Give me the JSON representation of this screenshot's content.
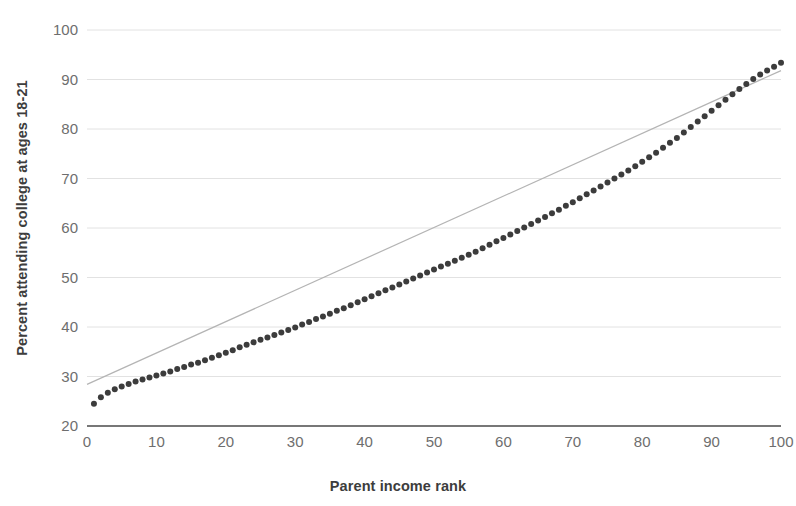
{
  "chart_data": {
    "type": "scatter",
    "title": "",
    "subtitle": "",
    "xlabel": "Parent income rank",
    "ylabel": "Percent attending college at ages 18-21",
    "xlim": [
      0,
      100
    ],
    "ylim": [
      20,
      100
    ],
    "xticks": [
      0,
      10,
      20,
      30,
      40,
      50,
      60,
      70,
      80,
      90,
      100
    ],
    "yticks": [
      20,
      30,
      40,
      50,
      60,
      70,
      80,
      90,
      100
    ],
    "grid": "horizontal",
    "legend": "none",
    "annotations": [],
    "series": [
      {
        "name": "Percent attending college at ages 18-21",
        "type": "scatter",
        "marker": "circle",
        "color": "#3c3c3c",
        "x": [
          1,
          2,
          3,
          4,
          5,
          6,
          7,
          8,
          9,
          10,
          11,
          12,
          13,
          14,
          15,
          16,
          17,
          18,
          19,
          20,
          21,
          22,
          23,
          24,
          25,
          26,
          27,
          28,
          29,
          30,
          31,
          32,
          33,
          34,
          35,
          36,
          37,
          38,
          39,
          40,
          41,
          42,
          43,
          44,
          45,
          46,
          47,
          48,
          49,
          50,
          51,
          52,
          53,
          54,
          55,
          56,
          57,
          58,
          59,
          60,
          61,
          62,
          63,
          64,
          65,
          66,
          67,
          68,
          69,
          70,
          71,
          72,
          73,
          74,
          75,
          76,
          77,
          78,
          79,
          80,
          81,
          82,
          83,
          84,
          85,
          86,
          87,
          88,
          89,
          90,
          91,
          92,
          93,
          94,
          95,
          96,
          97,
          98,
          99,
          100
        ],
        "y": [
          24.5,
          25.8,
          26.7,
          27.4,
          28.0,
          28.5,
          29.0,
          29.4,
          29.8,
          30.2,
          30.6,
          31.0,
          31.5,
          31.9,
          32.4,
          32.8,
          33.3,
          33.8,
          34.3,
          34.8,
          35.3,
          35.9,
          36.4,
          36.9,
          37.4,
          37.9,
          38.4,
          38.9,
          39.4,
          39.9,
          40.5,
          41.0,
          41.6,
          42.1,
          42.7,
          43.3,
          43.8,
          44.4,
          45.0,
          45.6,
          46.2,
          46.8,
          47.4,
          48.0,
          48.6,
          49.2,
          49.8,
          50.4,
          51.0,
          51.6,
          52.2,
          52.8,
          53.4,
          54.0,
          54.6,
          55.2,
          55.9,
          56.6,
          57.3,
          58.0,
          58.7,
          59.4,
          60.1,
          60.8,
          61.5,
          62.2,
          63.0,
          63.7,
          64.5,
          65.2,
          66.0,
          66.8,
          67.6,
          68.4,
          69.2,
          70.0,
          70.8,
          71.6,
          72.5,
          73.4,
          74.3,
          75.2,
          76.2,
          77.2,
          78.2,
          79.3,
          80.4,
          81.5,
          82.6,
          83.7,
          84.8,
          85.9,
          87.0,
          88.1,
          89.1,
          90.1,
          91.0,
          91.8,
          92.6,
          93.4
        ]
      },
      {
        "name": "Fitted line",
        "type": "line",
        "color": "#b4b4b4",
        "x": [
          0,
          100
        ],
        "y": [
          28.4,
          91.8
        ]
      },
      {
        "name": "Axis baseline",
        "type": "line",
        "color": "#4a4a4a",
        "x": [
          0,
          100
        ],
        "y": [
          20,
          20
        ]
      }
    ]
  },
  "axes": {
    "y_title": "Percent attending college at ages 18-21",
    "x_title": "Parent income rank"
  }
}
